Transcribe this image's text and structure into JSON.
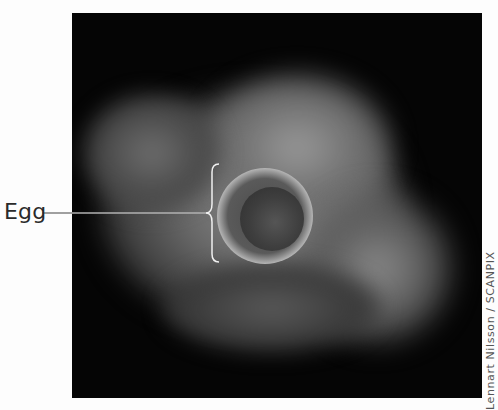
{
  "figure": {
    "image_description": "Dark-field micrograph of a human egg (oocyte) surrounded by a cloud of cumulus cells",
    "label": "Egg",
    "credit": "Lennart Nilsson / SCANPIX",
    "colors": {
      "background": "#fdfdfd",
      "photo_background": "#050505",
      "label_text": "#2a2a2a",
      "leader_line": "#ffffff"
    }
  }
}
